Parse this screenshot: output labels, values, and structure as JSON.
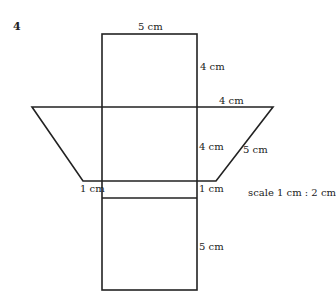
{
  "question_number": "4",
  "labels": {
    "top_width": "5 cm",
    "top_height": "4 cm",
    "trap_top_right": "4 cm",
    "middle_height": "4 cm",
    "slant": "5 cm",
    "left_strip": "1 cm",
    "right_strip": "1 cm",
    "bottom_height": "5 cm"
  },
  "scale_text": "scale 1 cm : 2 cm",
  "colors": {
    "line": "#222222",
    "background": "#ffffff"
  }
}
